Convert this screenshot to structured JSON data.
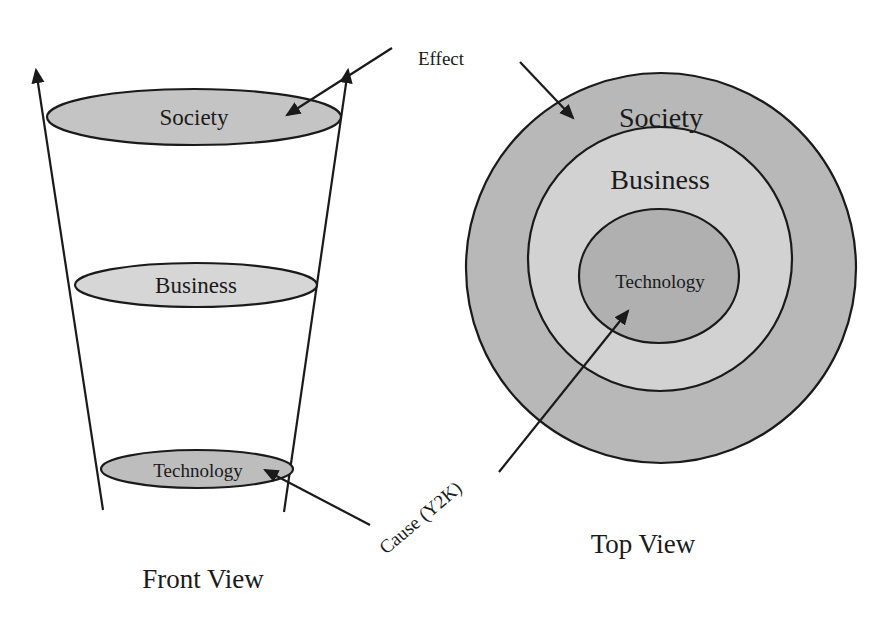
{
  "front_view": {
    "caption": "Front View",
    "layers": [
      {
        "label": "Society"
      },
      {
        "label": "Business"
      },
      {
        "label": "Technology"
      }
    ]
  },
  "top_view": {
    "caption": "Top View",
    "rings": [
      {
        "label": "Society"
      },
      {
        "label": "Business"
      },
      {
        "label": "Technology"
      }
    ]
  },
  "annotations": {
    "effect": "Effect",
    "cause": "Cause (Y2K)"
  },
  "colors": {
    "outer_fill": "#b8b8b8",
    "middle_fill": "#d2d2d2",
    "inner_fill": "#b0b0b0",
    "ellipse_society": "#c4c4c4",
    "ellipse_business": "#d6d6d6",
    "ellipse_technology": "#bdbdbd",
    "stroke": "#1a1a1a"
  }
}
